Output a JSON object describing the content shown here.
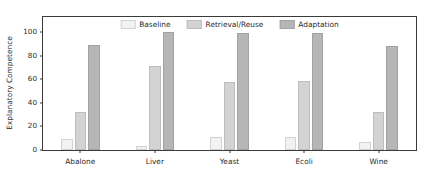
{
  "chart_data": {
    "type": "bar",
    "title": "",
    "xlabel": "",
    "ylabel": "Explanatory Competence",
    "categories": [
      "Abalone",
      "Liver",
      "Yeast",
      "Ecoli",
      "Wine"
    ],
    "series": [
      {
        "name": "Baseline",
        "values": [
          9,
          3,
          11,
          11,
          6
        ]
      },
      {
        "name": "Retrieval/Reuse",
        "values": [
          32,
          71,
          57,
          58,
          32
        ]
      },
      {
        "name": "Adaptation",
        "values": [
          89,
          100,
          99,
          99,
          88
        ]
      }
    ],
    "ylim": [
      0,
      113
    ],
    "yticks": [
      0,
      20,
      40,
      60,
      80,
      100
    ],
    "ytick_labels": [
      "0",
      "20",
      "40",
      "60",
      "80",
      "100"
    ],
    "grid": false,
    "legend_position": "upper center",
    "colors": {
      "baseline": "#f2f2f2",
      "retrieval": "#d3d3d3",
      "adaptation": "#b6b6b6",
      "axis": "#3b3b3b",
      "text": "#2b2b2b",
      "background": "#ffffff"
    }
  }
}
